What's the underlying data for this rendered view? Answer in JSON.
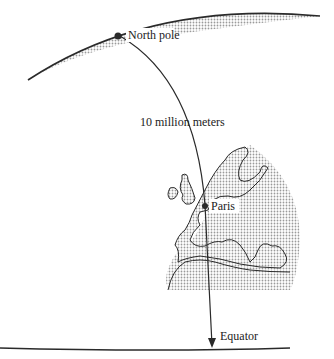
{
  "diagram": {
    "type": "meridian-measurement",
    "labels": {
      "north_pole": "North pole",
      "distance": "10 million meters",
      "paris": "Paris",
      "equator": "Equator"
    },
    "colors": {
      "stroke": "#2a2a2a",
      "shade": "#c8c8c8",
      "background": "#ffffff"
    }
  }
}
